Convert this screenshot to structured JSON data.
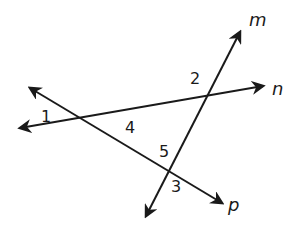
{
  "diagram": {
    "type": "intersecting-lines",
    "stroke_color": "#1a1a1a",
    "background": "#ffffff",
    "lines": [
      {
        "name": "m",
        "label": "m",
        "from": [
          146,
          216
        ],
        "to": [
          240,
          32
        ],
        "label_pos": [
          249,
          26
        ]
      },
      {
        "name": "n",
        "label": "n",
        "from": [
          20,
          128
        ],
        "to": [
          263,
          86
        ],
        "label_pos": [
          272,
          95
        ]
      },
      {
        "name": "p",
        "label": "p",
        "from": [
          30,
          88
        ],
        "to": [
          222,
          203
        ],
        "label_pos": [
          228,
          211
        ]
      }
    ],
    "angles": [
      {
        "label": "1",
        "pos": [
          41,
          122
        ]
      },
      {
        "label": "2",
        "pos": [
          190,
          84
        ]
      },
      {
        "label": "3",
        "pos": [
          171,
          192
        ]
      },
      {
        "label": "4",
        "pos": [
          125,
          133
        ]
      },
      {
        "label": "5",
        "pos": [
          159,
          157
        ]
      }
    ]
  }
}
